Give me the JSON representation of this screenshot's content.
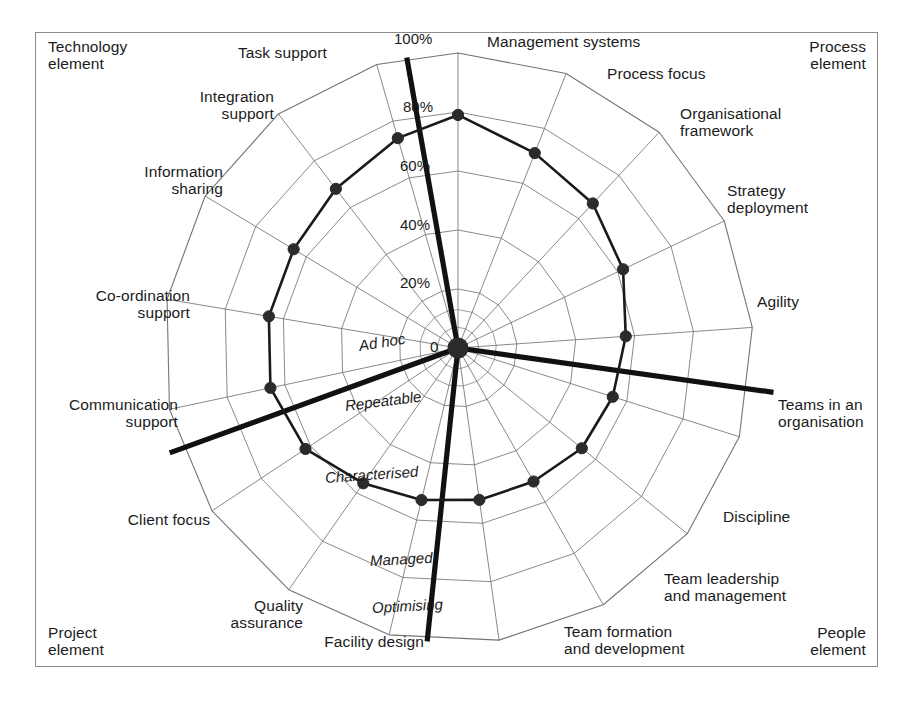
{
  "figure": {
    "title": "",
    "center": {
      "x": 458,
      "y": 348
    },
    "radius_100pct": 295
  },
  "chart_data": {
    "type": "radar",
    "title": "",
    "xlabel": "",
    "ylabel": "",
    "rlim": [
      0,
      100
    ],
    "runit": "%",
    "grid": true,
    "legend_position": "none",
    "radial_ticks": [
      "0",
      "20%",
      "40%",
      "60%",
      "80%",
      "100%"
    ],
    "radial_tick_values": [
      0,
      20,
      40,
      60,
      80,
      100
    ],
    "maturity_levels": [
      "Ad hoc",
      "Repeatable",
      "Characterised",
      "Managed",
      "Optimising"
    ],
    "group_labels": [
      "Technology element",
      "Process element",
      "People element",
      "Project element"
    ],
    "categories": [
      "Management systems",
      "Process focus",
      "Organisational framework",
      "Strategy deployment",
      "Agility",
      "Teams in an organisation",
      "Discipline",
      "Team leadership and management",
      "Team formation and development",
      "Facility design",
      "Quality assurance",
      "Client focus",
      "Communication support",
      "Co-ordination support",
      "Information sharing",
      "Integration support",
      "Task support"
    ],
    "values": [
      79,
      71,
      67,
      62,
      57,
      55,
      54,
      52,
      52,
      53,
      56,
      62,
      65,
      65,
      65,
      68,
      74
    ],
    "series": [
      {
        "name": "Maturity profile",
        "values": [
          79,
          71,
          67,
          62,
          57,
          55,
          54,
          52,
          52,
          53,
          56,
          62,
          65,
          65,
          65,
          68,
          74
        ]
      }
    ]
  },
  "axes": [
    {
      "id": "management-systems",
      "label": "Management systems",
      "angle": -90,
      "value": 79,
      "lines": [
        "Management systems"
      ]
    },
    {
      "id": "process-focus",
      "label": "Process focus",
      "angle": -68.5,
      "value": 71,
      "lines": [
        "Process focus"
      ]
    },
    {
      "id": "organisational-framework",
      "label": "Organisational framework",
      "angle": -47,
      "value": 67,
      "lines": [
        "Organisational",
        "framework"
      ]
    },
    {
      "id": "strategy-deployment",
      "label": "Strategy deployment",
      "angle": -25.5,
      "value": 62,
      "lines": [
        "Strategy",
        "deployment"
      ]
    },
    {
      "id": "agility",
      "label": "Agility",
      "angle": -4,
      "value": 57,
      "lines": [
        "Agility"
      ]
    },
    {
      "id": "teams-in-an-organisation",
      "label": "Teams in an organisation",
      "angle": 17.5,
      "value": 55,
      "lines": [
        "Teams in an",
        "organisation"
      ]
    },
    {
      "id": "discipline",
      "label": "Discipline",
      "angle": 39,
      "value": 54,
      "lines": [
        "Discipline"
      ]
    },
    {
      "id": "team-leadership-and-management",
      "label": "Team leadership and management",
      "angle": 60.5,
      "value": 52,
      "lines": [
        "Team leadership",
        "and management"
      ]
    },
    {
      "id": "team-formation-and-development",
      "label": "Team formation and development",
      "angle": 82,
      "value": 52,
      "lines": [
        "Team formation",
        "and development"
      ]
    },
    {
      "id": "facility-design",
      "label": "Facility design",
      "angle": 103.5,
      "value": 53,
      "lines": [
        "Facility design"
      ]
    },
    {
      "id": "quality-assurance",
      "label": "Quality assurance",
      "angle": 125,
      "value": 56,
      "lines": [
        "Quality",
        "assurance"
      ]
    },
    {
      "id": "client-focus",
      "label": "Client focus",
      "angle": 146.5,
      "value": 62,
      "lines": [
        "Client focus"
      ]
    },
    {
      "id": "communication-support",
      "label": "Communication support",
      "angle": 168,
      "value": 65,
      "lines": [
        "Communication",
        "support"
      ]
    },
    {
      "id": "co-ordination-support",
      "label": "Co-ordination support",
      "angle": -170.5,
      "value": 65,
      "lines": [
        "Co-ordination",
        "support"
      ]
    },
    {
      "id": "information-sharing",
      "label": "Information sharing",
      "angle": -149,
      "value": 65,
      "lines": [
        "Information",
        "sharing"
      ]
    },
    {
      "id": "integration-support",
      "label": "Integration support",
      "angle": -127.5,
      "value": 68,
      "lines": [
        "Integration",
        "support"
      ]
    },
    {
      "id": "task-support",
      "label": "Task support",
      "angle": -106,
      "value": 74,
      "lines": [
        "Task support"
      ]
    }
  ],
  "corner_labels": [
    {
      "id": "technology-element",
      "lines": [
        "Technology",
        "element"
      ],
      "x": 48,
      "y": 38,
      "align": "left"
    },
    {
      "id": "process-element",
      "lines": [
        "Process",
        "element"
      ],
      "x": 866,
      "y": 38,
      "align": "right"
    },
    {
      "id": "people-element",
      "lines": [
        "People",
        "element"
      ],
      "x": 866,
      "y": 624,
      "align": "right"
    },
    {
      "id": "project-element",
      "lines": [
        "Project",
        "element"
      ],
      "x": 48,
      "y": 624,
      "align": "left"
    }
  ],
  "axis_labels": [
    {
      "id": "task-support",
      "lines": [
        "Task support"
      ],
      "x": 327,
      "y": 44,
      "align": "right"
    },
    {
      "id": "management-systems",
      "lines": [
        "Management systems"
      ],
      "x": 487,
      "y": 33,
      "align": "left"
    },
    {
      "id": "process-focus",
      "lines": [
        "Process focus"
      ],
      "x": 607,
      "y": 65,
      "align": "left"
    },
    {
      "id": "organisational-framework",
      "lines": [
        "Organisational",
        "framework"
      ],
      "x": 680,
      "y": 105,
      "align": "left"
    },
    {
      "id": "strategy-deployment",
      "lines": [
        "Strategy",
        "deployment"
      ],
      "x": 727,
      "y": 182,
      "align": "left"
    },
    {
      "id": "agility",
      "lines": [
        "Agility"
      ],
      "x": 757,
      "y": 293,
      "align": "left"
    },
    {
      "id": "teams-in-an-organisation",
      "lines": [
        "Teams in an",
        "organisation"
      ],
      "x": 778,
      "y": 396,
      "align": "left"
    },
    {
      "id": "discipline",
      "lines": [
        "Discipline"
      ],
      "x": 723,
      "y": 508,
      "align": "left"
    },
    {
      "id": "team-leadership-and-management",
      "lines": [
        "Team leadership",
        "and management"
      ],
      "x": 664,
      "y": 570,
      "align": "left"
    },
    {
      "id": "team-formation-and-development",
      "lines": [
        "Team formation",
        "and development"
      ],
      "x": 564,
      "y": 623,
      "align": "left"
    },
    {
      "id": "facility-design",
      "lines": [
        "Facility design"
      ],
      "x": 424,
      "y": 633,
      "align": "right"
    },
    {
      "id": "quality-assurance",
      "lines": [
        "Quality",
        "assurance"
      ],
      "x": 303,
      "y": 597,
      "align": "right"
    },
    {
      "id": "client-focus",
      "lines": [
        "Client focus"
      ],
      "x": 210,
      "y": 511,
      "align": "right"
    },
    {
      "id": "communication-support",
      "lines": [
        "Communication",
        "support"
      ],
      "x": 178,
      "y": 396,
      "align": "right"
    },
    {
      "id": "co-ordination-support",
      "lines": [
        "Co-ordination",
        "support"
      ],
      "x": 190,
      "y": 287,
      "align": "right"
    },
    {
      "id": "information-sharing",
      "lines": [
        "Information",
        "sharing"
      ],
      "x": 223,
      "y": 163,
      "align": "right"
    },
    {
      "id": "integration-support",
      "lines": [
        "Integration",
        "support"
      ],
      "x": 274,
      "y": 88,
      "align": "right"
    }
  ],
  "scale_labels": [
    {
      "id": "tick-0",
      "text": "0",
      "x": 430,
      "y": 338
    },
    {
      "id": "tick-20",
      "text": "20%",
      "x": 400,
      "y": 274
    },
    {
      "id": "tick-40",
      "text": "40%",
      "x": 400,
      "y": 216
    },
    {
      "id": "tick-60",
      "text": "60%",
      "x": 400,
      "y": 157
    },
    {
      "id": "tick-80",
      "text": "80%",
      "x": 403,
      "y": 98
    },
    {
      "id": "tick-100",
      "text": "100%",
      "x": 394,
      "y": 30
    }
  ],
  "maturity_labels": [
    {
      "id": "ad-hoc",
      "text": "Ad hoc",
      "x": 359,
      "y": 337,
      "rot": -9
    },
    {
      "id": "repeatable",
      "text": "Repeatable",
      "x": 345,
      "y": 397,
      "rot": -7
    },
    {
      "id": "characterised",
      "text": "Characterised",
      "x": 325,
      "y": 469,
      "rot": -4
    },
    {
      "id": "managed",
      "text": "Managed",
      "x": 370,
      "y": 552,
      "rot": -3
    },
    {
      "id": "optimising",
      "text": "Optimising",
      "x": 372,
      "y": 599,
      "rot": -3
    }
  ],
  "dividers": [
    {
      "id": "divider-technology-process",
      "angle": -100,
      "from": 0,
      "to": 100
    },
    {
      "id": "divider-process-people",
      "angle": 8,
      "from": 0,
      "to": 108
    },
    {
      "id": "divider-people-project",
      "angle": 96,
      "from": 0,
      "to": 100
    },
    {
      "id": "divider-project-technology",
      "angle": 160,
      "from": 0,
      "to": 104
    }
  ],
  "colors": {
    "frame_border": "#8a8a8a",
    "grid": "#6d6d6d",
    "series_line": "#1a1a1a",
    "series_marker": "#2b2b2b",
    "divider": "#111111",
    "background": "#ffffff",
    "text": "#1b1b1b"
  }
}
